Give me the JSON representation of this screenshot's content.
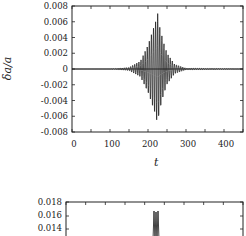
{
  "chart_data": [
    {
      "type": "line",
      "title": "",
      "xlabel": "t",
      "ylabel": "δa/a",
      "xlim": [
        0,
        450
      ],
      "ylim": [
        -0.008,
        0.008
      ],
      "x_ticks": [
        "0",
        "100",
        "200",
        "300",
        "400"
      ],
      "y_ticks": [
        "0.008",
        "0.006",
        "0.004",
        "0.002",
        "0",
        "-0.002",
        "-0.004",
        "-0.006",
        "-0.008"
      ],
      "grid": false,
      "legend": null,
      "series": [
        {
          "name": "δa/a oscillation",
          "description": "Oscillating wave packet centered near t≈225, zero elsewhere",
          "x": [
            0,
            100,
            150,
            180,
            200,
            210,
            220,
            225,
            230,
            240,
            250,
            270,
            300,
            450
          ],
          "envelope": [
            0,
            0,
            0.0002,
            0.001,
            0.003,
            0.0045,
            0.006,
            0.0072,
            0.0055,
            0.0035,
            0.002,
            0.0006,
            0.0001,
            0
          ]
        }
      ]
    },
    {
      "type": "line",
      "title": "",
      "xlabel": "",
      "ylabel": "",
      "ylim_visible": [
        0.014,
        0.018
      ],
      "y_ticks": [
        "0.018",
        "0.016",
        "0.014"
      ],
      "grid": false,
      "series": [
        {
          "name": "spike",
          "description": "Narrow spikes near t≈225 reaching ~0.0165",
          "x": [
            220,
            225,
            228
          ],
          "values": [
            0.0165,
            0.0162,
            0.0165
          ]
        }
      ]
    }
  ],
  "plot1": {
    "ylabel": "δa/a",
    "xlabel": "t",
    "yticks": [
      "0.008",
      "0.006",
      "0.004",
      "0.002",
      "0",
      "-0.002",
      "-0.004",
      "-0.006",
      "-0.008"
    ],
    "xticks": [
      "0",
      "100",
      "200",
      "300",
      "400"
    ]
  },
  "plot2": {
    "yticks": [
      "0.018",
      "0.016",
      "0.014"
    ]
  }
}
